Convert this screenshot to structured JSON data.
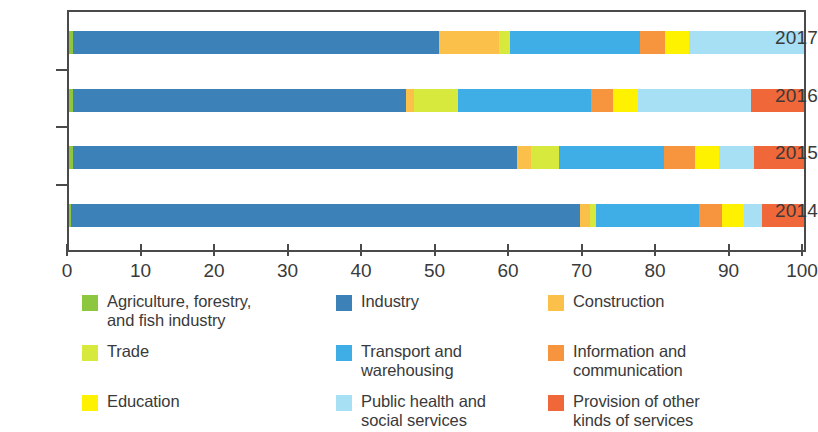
{
  "chart_data": {
    "type": "bar",
    "orientation": "horizontal",
    "stacked": true,
    "normalized_percent": true,
    "title": "",
    "xlabel": "",
    "ylabel": "",
    "xlim": [
      0,
      100
    ],
    "xticks": [
      "0",
      "10",
      "20",
      "30",
      "40",
      "50",
      "60",
      "70",
      "80",
      "90",
      "100"
    ],
    "grid": false,
    "legend_position": "bottom",
    "categories": [
      "2017",
      "2016",
      "2015",
      "2014"
    ],
    "series": [
      {
        "name": "Agriculture, forestry,\nand fish industry",
        "color": "#8DC63F",
        "values": [
          0.5,
          0.5,
          0.5,
          0.3
        ]
      },
      {
        "name": "Industry",
        "color": "#3C82B8",
        "values": [
          49.8,
          45.4,
          60.5,
          69.2
        ]
      },
      {
        "name": "Construction",
        "color": "#FBC04A",
        "values": [
          8.2,
          1.1,
          1.8,
          1.4
        ]
      },
      {
        "name": "Trade",
        "color": "#D7E93D",
        "values": [
          1.5,
          5.9,
          3.9,
          0.8
        ]
      },
      {
        "name": "Transport and\nwarehousing",
        "color": "#3FADE6",
        "values": [
          17.7,
          18.1,
          14.3,
          14.0
        ]
      },
      {
        "name": "Information and\ncommunication",
        "color": "#F7943E",
        "values": [
          3.4,
          3.0,
          4.2,
          3.1
        ]
      },
      {
        "name": "Education",
        "color": "#FFF200",
        "values": [
          3.3,
          3.4,
          3.2,
          3.0
        ]
      },
      {
        "name": "Public health and\nsocial services",
        "color": "#A7DFF5",
        "values": [
          15.6,
          15.4,
          4.8,
          2.5
        ]
      },
      {
        "name": "Provision of other\nkinds of services",
        "color": "#F0673A",
        "values": [
          0.0,
          7.2,
          6.8,
          5.7
        ]
      }
    ]
  },
  "axis": {
    "y_labels": [
      "2017",
      "2016",
      "2015",
      "2014"
    ],
    "x_labels": [
      "0",
      "10",
      "20",
      "30",
      "40",
      "50",
      "60",
      "70",
      "80",
      "90",
      "100"
    ]
  },
  "legend": {
    "columns": [
      [
        {
          "label": "Agriculture, forestry,\nand fish industry",
          "color": "#8DC63F"
        },
        {
          "label": "Trade",
          "color": "#D7E93D"
        },
        {
          "label": "Education",
          "color": "#FFF200"
        }
      ],
      [
        {
          "label": "Industry",
          "color": "#3C82B8"
        },
        {
          "label": "Transport and\nwarehousing",
          "color": "#3FADE6"
        },
        {
          "label": "Public health and\nsocial services",
          "color": "#A7DFF5"
        }
      ],
      [
        {
          "label": "Construction",
          "color": "#FBC04A"
        },
        {
          "label": "Information and\ncommunication",
          "color": "#F7943E"
        },
        {
          "label": "Provision of other\nkinds of services",
          "color": "#F0673A"
        }
      ]
    ]
  }
}
